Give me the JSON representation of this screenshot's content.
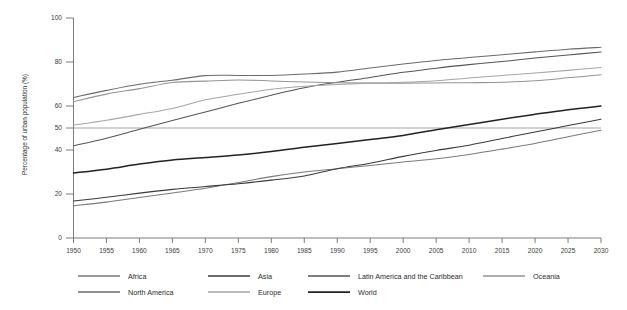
{
  "chart_data": {
    "type": "line",
    "title": "",
    "xlabel": "",
    "ylabel": "Percentage of urban population (%)",
    "xlim": [
      1950,
      2030
    ],
    "ylim": [
      0,
      100
    ],
    "grid": false,
    "legend_position": "bottom",
    "reference_lines": [
      {
        "axis": "y",
        "value": 50
      }
    ],
    "x": [
      1950,
      1955,
      1960,
      1965,
      1970,
      1975,
      1980,
      1985,
      1990,
      1995,
      2000,
      2005,
      2010,
      2015,
      2020,
      2025,
      2030
    ],
    "xtick_labels": [
      "1950",
      "1955",
      "1960",
      "1965",
      "1970",
      "1975",
      "1980",
      "1985",
      "1990",
      "1995",
      "2000",
      "2005",
      "2010",
      "2015",
      "2020",
      "2025",
      "2030"
    ],
    "ytick_values": [
      0,
      20,
      40,
      50,
      60,
      80,
      100
    ],
    "ytick_labels": [
      "0",
      "20",
      "40",
      "50",
      "60",
      "80",
      "100"
    ],
    "series": [
      {
        "name": "Africa",
        "color": "#7a7a7a",
        "width": 1.05,
        "values": [
          14.7,
          16.3,
          18.4,
          20.5,
          22.6,
          25.2,
          27.9,
          30.0,
          31.5,
          33.0,
          34.5,
          36.0,
          38.0,
          40.4,
          43.0,
          46.0,
          49.0
        ]
      },
      {
        "name": "Asia",
        "color": "#3a3a3a",
        "width": 1.05,
        "values": [
          16.8,
          18.5,
          20.4,
          22.1,
          23.4,
          24.7,
          26.3,
          28.2,
          31.5,
          34.0,
          37.1,
          39.8,
          42.2,
          45.2,
          48.2,
          51.1,
          54.0
        ]
      },
      {
        "name": "Latin America and the Caribbean",
        "color": "#555555",
        "width": 1.05,
        "values": [
          41.9,
          45.3,
          49.4,
          53.4,
          57.3,
          61.2,
          64.9,
          68.3,
          70.8,
          73.0,
          75.3,
          77.2,
          78.8,
          80.2,
          81.8,
          83.2,
          84.5
        ]
      },
      {
        "name": "Oceania",
        "color": "#949494",
        "width": 1.05,
        "values": [
          62.0,
          65.4,
          67.9,
          70.7,
          71.3,
          71.8,
          71.4,
          70.9,
          70.6,
          70.4,
          70.4,
          70.5,
          70.6,
          70.8,
          71.5,
          72.8,
          74.2
        ]
      },
      {
        "name": "North America",
        "color": "#6b6b6b",
        "width": 1.05,
        "values": [
          63.9,
          67.1,
          69.9,
          71.7,
          73.8,
          73.9,
          73.9,
          74.5,
          75.4,
          77.3,
          79.1,
          80.7,
          82.0,
          83.3,
          84.6,
          85.8,
          86.7
        ]
      },
      {
        "name": "Europe",
        "color": "#a6a6a6",
        "width": 1.05,
        "values": [
          51.3,
          53.5,
          56.2,
          58.9,
          62.8,
          65.3,
          67.6,
          69.0,
          69.8,
          70.4,
          70.8,
          71.5,
          72.7,
          73.9,
          75.0,
          76.2,
          77.5
        ]
      },
      {
        "name": "World",
        "color": "#222222",
        "width": 1.5,
        "values": [
          29.6,
          31.3,
          33.6,
          35.5,
          36.6,
          37.7,
          39.3,
          41.2,
          43.0,
          44.8,
          46.6,
          49.2,
          51.6,
          54.0,
          56.2,
          58.3,
          60.0
        ]
      }
    ]
  },
  "legend": {
    "row1": [
      {
        "label": "Africa"
      },
      {
        "label": "Asia"
      },
      {
        "label": "Latin America and the Caribbean"
      },
      {
        "label": "Oceania"
      }
    ],
    "row2": [
      {
        "label": "North America"
      },
      {
        "label": "Europe"
      },
      {
        "label": "World"
      }
    ]
  }
}
